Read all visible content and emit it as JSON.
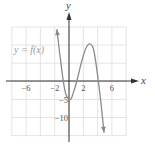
{
  "chart_data": {
    "type": "line",
    "title": "",
    "xlabel": "x",
    "ylabel": "y",
    "curve_label": "y = f(x)",
    "xlim": [
      -8,
      8
    ],
    "ylim": [
      -13.5,
      15
    ],
    "grid": true,
    "grid_x_step": 2,
    "grid_y_step": 5,
    "x_ticks": [
      {
        "value": -6,
        "label": "−6"
      },
      {
        "value": -2,
        "label": "−2"
      },
      {
        "value": 2,
        "label": "2"
      },
      {
        "value": 6,
        "label": "6"
      }
    ],
    "y_ticks": [
      {
        "value": -5,
        "label": "−5"
      },
      {
        "value": -10,
        "label": "−10"
      }
    ],
    "series": [
      {
        "name": "y = f(x)",
        "description": "cubic-like curve, arrows at both ends (up-left, down-right)",
        "points": [
          [
            -1.7,
            14
          ],
          [
            -1.3,
            7.5
          ],
          [
            -0.8,
            0
          ],
          [
            -0.4,
            -3.8
          ],
          [
            0.2,
            -5
          ],
          [
            0.6,
            -3.2
          ],
          [
            1.1,
            0
          ],
          [
            1.8,
            5.5
          ],
          [
            2.4,
            9
          ],
          [
            3.0,
            10
          ],
          [
            3.5,
            8
          ],
          [
            4.1,
            0
          ],
          [
            4.5,
            -6.5
          ],
          [
            4.9,
            -14
          ]
        ],
        "arrows": [
          "start",
          "end"
        ]
      }
    ],
    "colors": {
      "curve": "#8a8a8a",
      "axis": "#333333",
      "grid": "#dddddd"
    }
  }
}
